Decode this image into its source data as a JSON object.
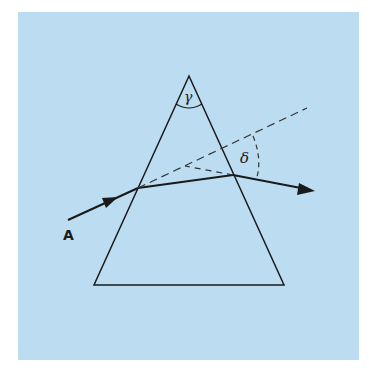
{
  "figure": {
    "background_color": "#bcdcf2",
    "line_color": "#1a1a1a",
    "labels": {
      "apex_angle": "γ",
      "deviation_angle": "δ",
      "incoming_ray": "A"
    }
  }
}
